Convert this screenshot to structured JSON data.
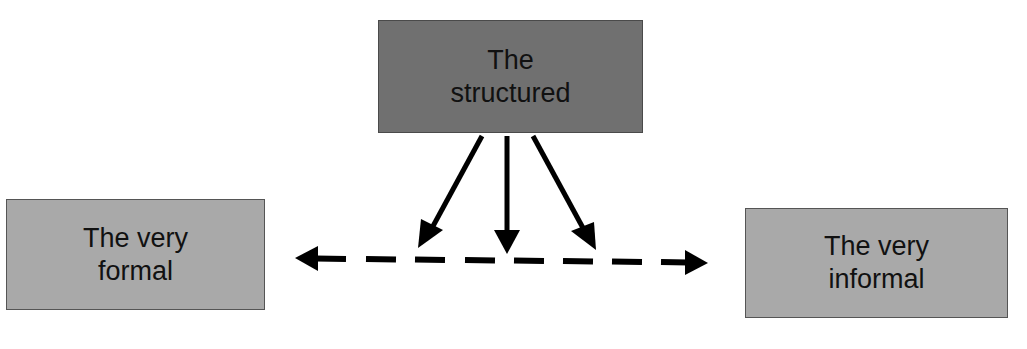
{
  "diagram": {
    "nodes": {
      "top": {
        "line1": "The",
        "line2": "structured",
        "fill": "#707070"
      },
      "left": {
        "line1": "The very",
        "line2": "formal",
        "fill": "#a9a9a9"
      },
      "right": {
        "line1": "The very",
        "line2": "informal",
        "fill": "#a9a9a9"
      }
    },
    "edges": [
      {
        "from": "top",
        "to": "continuum",
        "style": "solid",
        "direction": "down-left"
      },
      {
        "from": "top",
        "to": "continuum",
        "style": "solid",
        "direction": "down"
      },
      {
        "from": "top",
        "to": "continuum",
        "style": "solid",
        "direction": "down-right"
      },
      {
        "from": "left",
        "to": "right",
        "style": "dashed",
        "bidirectional": true
      }
    ]
  }
}
